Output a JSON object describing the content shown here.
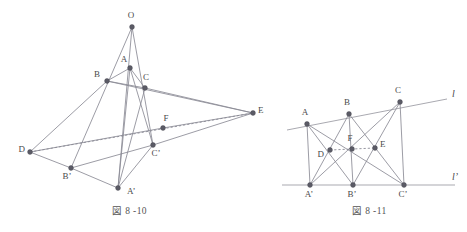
{
  "figures": [
    {
      "id": "fig-8-10",
      "caption": "図 8 -10",
      "description": "Desargues configuration in space: two triangles ABC and A'B'C' in perspective from point O, with the axis of perspectivity through D, F and E",
      "points": [
        {
          "name": "O",
          "label": "O",
          "x": 132,
          "y": 27,
          "lx": 131,
          "ly": 18,
          "anchor": "middle"
        },
        {
          "name": "A",
          "label": "A",
          "x": 130,
          "y": 68,
          "lx": 124,
          "ly": 62,
          "anchor": "middle"
        },
        {
          "name": "B",
          "label": "B",
          "x": 107,
          "y": 81,
          "lx": 100,
          "ly": 77,
          "anchor": "end"
        },
        {
          "name": "C",
          "label": "C",
          "x": 145,
          "y": 88,
          "lx": 146,
          "ly": 80,
          "anchor": "middle"
        },
        {
          "name": "D",
          "label": "D",
          "x": 30,
          "y": 152,
          "lx": 25,
          "ly": 152,
          "anchor": "end"
        },
        {
          "name": "E",
          "label": "E",
          "x": 253,
          "y": 113,
          "lx": 258,
          "ly": 113,
          "anchor": "start"
        },
        {
          "name": "F",
          "label": "F",
          "x": 163,
          "y": 128,
          "lx": 166,
          "ly": 121,
          "anchor": "middle"
        },
        {
          "name": "Cp",
          "label": "C’",
          "x": 153,
          "y": 145,
          "lx": 156,
          "ly": 156,
          "anchor": "middle"
        },
        {
          "name": "Bp",
          "label": "B’",
          "x": 71,
          "y": 168,
          "lx": 67,
          "ly": 179,
          "anchor": "middle"
        },
        {
          "name": "Ap",
          "label": "A’",
          "x": 118,
          "y": 188,
          "lx": 127,
          "ly": 194,
          "anchor": "start"
        }
      ],
      "segments": [
        {
          "from": "O",
          "to": "Ap",
          "style": "solid"
        },
        {
          "from": "O",
          "to": "Bp",
          "style": "solid"
        },
        {
          "from": "O",
          "to": "Cp",
          "style": "solid"
        },
        {
          "from": "A",
          "to": "B",
          "style": "solid"
        },
        {
          "from": "B",
          "to": "C",
          "style": "solid"
        },
        {
          "from": "C",
          "to": "A",
          "style": "solid"
        },
        {
          "from": "Ap",
          "to": "Bp",
          "style": "solid"
        },
        {
          "from": "Bp",
          "to": "Cp",
          "style": "solid"
        },
        {
          "from": "Cp",
          "to": "Ap",
          "style": "solid"
        },
        {
          "from": "D",
          "to": "B",
          "style": "solid"
        },
        {
          "from": "D",
          "to": "Bp",
          "style": "solid"
        },
        {
          "from": "D",
          "to": "E",
          "style": "dashed"
        },
        {
          "from": "B",
          "to": "E",
          "style": "solid"
        },
        {
          "from": "Cp",
          "to": "E",
          "style": "solid"
        },
        {
          "from": "C",
          "to": "E",
          "style": "solid"
        },
        {
          "from": "F",
          "to": "E",
          "style": "solid"
        },
        {
          "from": "D",
          "to": "F",
          "style": "solid"
        },
        {
          "from": "A",
          "to": "Ap",
          "style": "solid"
        },
        {
          "from": "A",
          "to": "Cp",
          "style": "solid"
        },
        {
          "from": "C",
          "to": "Ap",
          "style": "solid"
        }
      ]
    },
    {
      "id": "fig-8-11",
      "caption": "図 8 -11",
      "description": "Plane Desargues configuration: triangle ABC on line l and triangle A'B'C' on line l', with D, F, E collinear",
      "lines": [
        {
          "name": "l",
          "label": "l",
          "x1": 287,
          "y1": 130,
          "x2": 447,
          "y2": 99,
          "lx": 452,
          "ly": 97
        },
        {
          "name": "lp",
          "label": "l’",
          "x1": 282,
          "y1": 185,
          "x2": 455,
          "y2": 185,
          "lx": 452,
          "ly": 180
        }
      ],
      "points": [
        {
          "name": "A",
          "label": "A",
          "x": 307,
          "y": 124,
          "lx": 305,
          "ly": 115,
          "anchor": "middle"
        },
        {
          "name": "B",
          "label": "B",
          "x": 349,
          "y": 114,
          "lx": 347,
          "ly": 105,
          "anchor": "middle"
        },
        {
          "name": "C",
          "label": "C",
          "x": 400,
          "y": 102,
          "lx": 398,
          "ly": 93,
          "anchor": "middle"
        },
        {
          "name": "D",
          "label": "D",
          "x": 330,
          "y": 150,
          "lx": 324,
          "ly": 157,
          "anchor": "end"
        },
        {
          "name": "F",
          "label": "F",
          "x": 352,
          "y": 149,
          "lx": 350,
          "ly": 141,
          "anchor": "middle"
        },
        {
          "name": "E",
          "label": "E",
          "x": 375,
          "y": 148,
          "lx": 380,
          "ly": 147,
          "anchor": "start"
        },
        {
          "name": "Ap",
          "label": "A’",
          "x": 310,
          "y": 185,
          "lx": 309,
          "ly": 197,
          "anchor": "middle"
        },
        {
          "name": "Bp",
          "label": "B’",
          "x": 353,
          "y": 185,
          "lx": 352,
          "ly": 197,
          "anchor": "middle"
        },
        {
          "name": "Cp",
          "label": "C’",
          "x": 404,
          "y": 185,
          "lx": 403,
          "ly": 197,
          "anchor": "middle"
        }
      ],
      "segments": [
        {
          "from": "A",
          "to": "Ap",
          "style": "solid"
        },
        {
          "from": "A",
          "to": "Bp",
          "style": "solid"
        },
        {
          "from": "A",
          "to": "Cp",
          "style": "solid"
        },
        {
          "from": "B",
          "to": "Ap",
          "style": "solid"
        },
        {
          "from": "B",
          "to": "Bp",
          "style": "solid"
        },
        {
          "from": "B",
          "to": "Cp",
          "style": "solid"
        },
        {
          "from": "C",
          "to": "Ap",
          "style": "solid"
        },
        {
          "from": "C",
          "to": "Bp",
          "style": "solid"
        },
        {
          "from": "C",
          "to": "Cp",
          "style": "solid"
        },
        {
          "from": "D",
          "to": "E",
          "style": "dashed"
        }
      ]
    }
  ],
  "style": {
    "stroke_color": "#8a8a95",
    "vertex_color": "#5b5b66",
    "label_color": "#4a4a4a",
    "background": "#ffffff"
  }
}
